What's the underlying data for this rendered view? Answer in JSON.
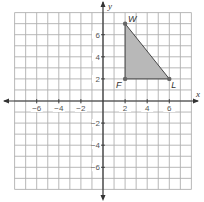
{
  "chart_data": {
    "type": "scatter",
    "title": "",
    "xlabel": "x",
    "ylabel": "y",
    "xlim": [
      -8,
      8
    ],
    "ylim": [
      -8,
      8
    ],
    "grid": true,
    "grid_step": 1,
    "x_tick_labels": [
      "-6",
      "-4",
      "-2",
      "2",
      "4",
      "6"
    ],
    "x_tick_values": [
      -6,
      -4,
      -2,
      2,
      4,
      6
    ],
    "y_tick_labels": [
      "6",
      "4",
      "2",
      "-2",
      "-4",
      "-6"
    ],
    "y_tick_values": [
      6,
      4,
      2,
      -2,
      -4,
      -6
    ],
    "shape": {
      "kind": "triangle",
      "fill": "#b8b8b8",
      "vertices": [
        {
          "label": "W",
          "x": 2,
          "y": 7
        },
        {
          "label": "F",
          "x": 2,
          "y": 2
        },
        {
          "label": "L",
          "x": 6,
          "y": 2
        }
      ]
    }
  },
  "colors": {
    "grid": "#b0b0b0",
    "axis": "#333333",
    "fill": "#b8b8b8",
    "point": "#666666"
  }
}
